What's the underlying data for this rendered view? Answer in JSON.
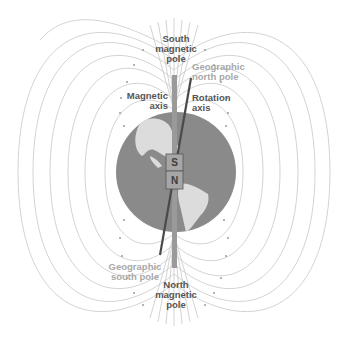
{
  "figure": {
    "colors": {
      "background": "#ffffff",
      "globe_ocean": "#8a8a8a",
      "globe_land": "#dcdcdc",
      "field_lines": "#c8c8c8",
      "magnetic_axis": "#9a9a9a",
      "rotation_axis": "#4a4a4a",
      "magnet_fill": "#a6a6a6",
      "magnet_border": "#555555",
      "label_dark": "#555555",
      "label_light": "#a8a8a8"
    }
  },
  "labels": {
    "south_magnetic_pole": {
      "line1": "South",
      "line2": "magnetic",
      "line3": "pole"
    },
    "geographic_north_pole": {
      "line1": "Geographic",
      "line2": "north pole"
    },
    "magnetic_axis": {
      "line1": "Magnetic",
      "line2": "axis"
    },
    "rotation_axis": {
      "line1": "Rotation",
      "line2": "axis"
    },
    "geographic_south_pole": {
      "line1": "Geographic",
      "line2": "south pole"
    },
    "north_magnetic_pole": {
      "line1": "North",
      "line2": "magnetic",
      "line3": "pole"
    }
  },
  "magnet": {
    "top_letter": "S",
    "bottom_letter": "N"
  }
}
